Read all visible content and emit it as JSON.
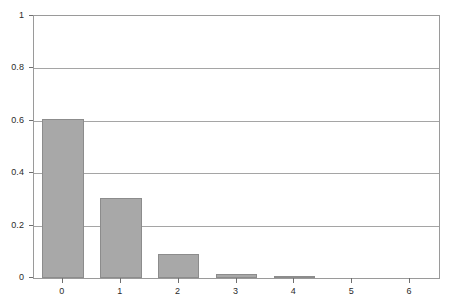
{
  "chart_data": {
    "type": "bar",
    "title": "",
    "subtitle": "",
    "xlabel": "",
    "ylabel": "",
    "categories": [
      "0",
      "1",
      "2",
      "3",
      "4",
      "5",
      "6"
    ],
    "values": [
      0.607,
      0.305,
      0.092,
      0.017,
      0.008,
      0.0,
      0.0
    ],
    "series": [
      {
        "name": "probability",
        "values": [
          0.607,
          0.305,
          0.092,
          0.017,
          0.008,
          0.0,
          0.0
        ]
      }
    ],
    "ylim": [
      0,
      1
    ],
    "xlim": [
      -0.5,
      6.5
    ],
    "y_ticks": [
      0,
      0.2,
      0.4,
      0.6,
      0.8,
      1
    ],
    "y_tick_labels": [
      "0",
      "0.2",
      "0.4",
      "0.6",
      "0.8",
      "1"
    ],
    "x_ticks": [
      0,
      1,
      2,
      3,
      4,
      5,
      6
    ],
    "x_tick_labels": [
      "0",
      "1",
      "2",
      "3",
      "4",
      "5",
      "6"
    ],
    "grid": {
      "horizontal": true,
      "vertical": false
    },
    "legend": {
      "visible": false,
      "position": "none",
      "entries": []
    },
    "annotations": [],
    "colors": {
      "bar_fill": "#a8a8a8",
      "bar_border": "#8c8c8c",
      "gridline": "#a5a5a5",
      "axis_line": "#9a9a9a",
      "tick_mark": "#6f6f6f",
      "tick_label": "#2b2b2b",
      "background": "#ffffff"
    }
  }
}
